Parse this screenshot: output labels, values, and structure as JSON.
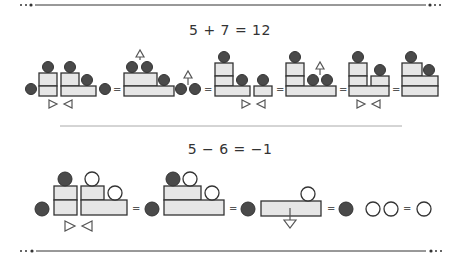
{
  "addition": {
    "equation": "5 + 7  =  12",
    "steps": [
      "5 blocks + 7 blocks with marker arrows",
      "move two dots up",
      "stacked form with one dot moved up",
      "regroup",
      "12"
    ]
  },
  "subtraction": {
    "equation": "5 − 6  =  −1",
    "steps": [
      "5 filled + 6 hollow",
      "regrouped",
      "remove block",
      "one filled, two hollow",
      "one hollow"
    ]
  },
  "colors": {
    "filled_dot": "#4a4a4a",
    "block_fill": "#e6e6e6",
    "block_stroke": "#333333",
    "arrow_stroke": "#555555",
    "rule": "#333333",
    "divider": "#aaaaaa"
  },
  "symbols": {
    "equals": "="
  }
}
